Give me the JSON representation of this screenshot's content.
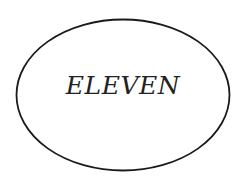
{
  "diagram": {
    "shape": "ellipse",
    "label": "ELEVEN",
    "stroke_color": "#1a1a1a",
    "fill_color": "#ffffff",
    "text_color": "#222222"
  }
}
